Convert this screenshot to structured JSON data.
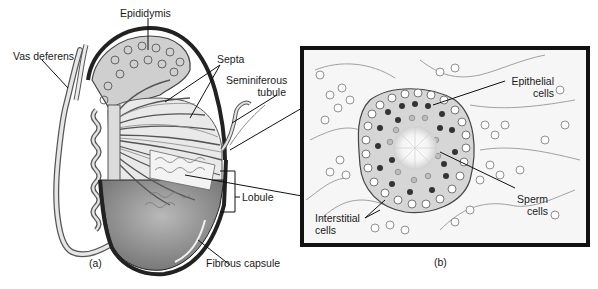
{
  "figure": {
    "panel_a": {
      "caption": "(a)",
      "labels": {
        "epididymis": "Epididymis",
        "vas_deferens": "Vas deferens",
        "septa": "Septa",
        "seminiferous_tubule_1": "Seminiferous",
        "seminiferous_tubule_2": "tubule",
        "lobule": "Lobule",
        "fibrous_capsule": "Fibrous capsule"
      }
    },
    "panel_b": {
      "caption": "(b)",
      "labels": {
        "epithelial_1": "Epithelial",
        "epithelial_2": "cells",
        "sperm_1": "Sperm",
        "sperm_2": "cells",
        "interstitial_1": "Interstitial",
        "interstitial_2": "cells"
      }
    }
  }
}
